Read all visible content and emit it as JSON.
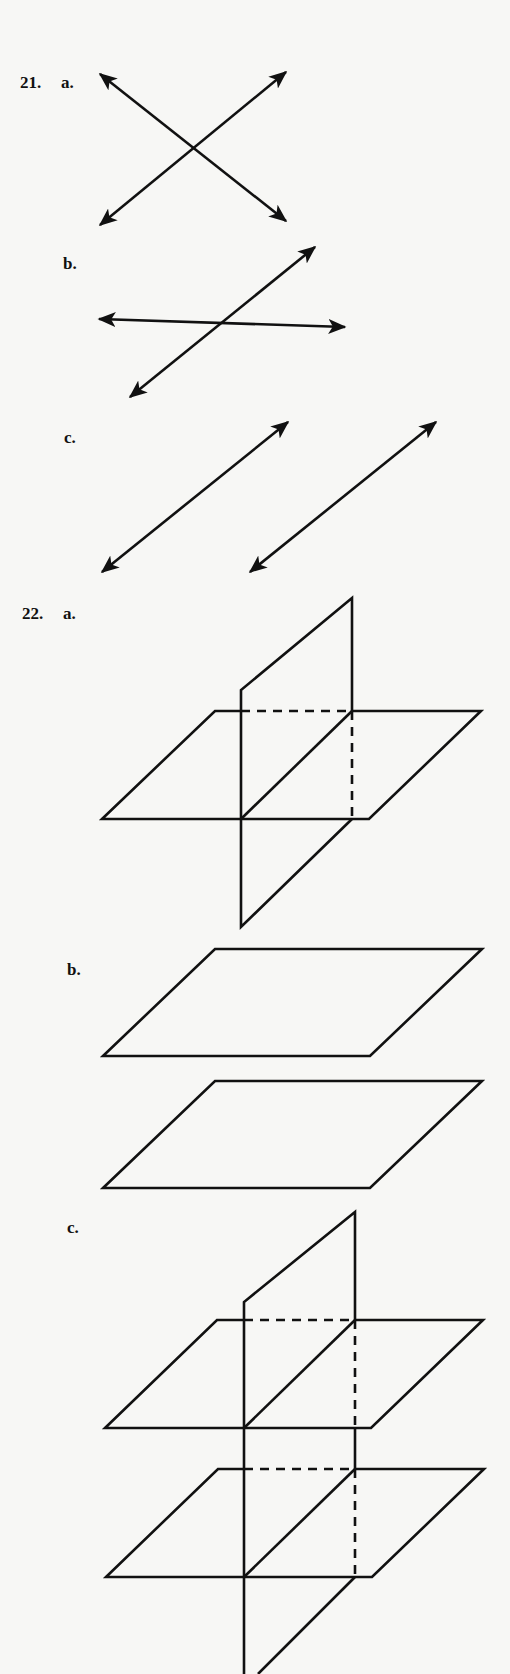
{
  "problems": [
    {
      "number": "21.",
      "parts": [
        {
          "letter": "a.",
          "description": "Two lines intersecting at a point"
        },
        {
          "letter": "b.",
          "description": "Two intersecting lines, one nearly horizontal"
        },
        {
          "letter": "c.",
          "description": "Two parallel lines"
        }
      ]
    },
    {
      "number": "22.",
      "parts": [
        {
          "letter": "a.",
          "description": "Vertical plane intersecting a horizontal plane"
        },
        {
          "letter": "b.",
          "description": "Two parallel horizontal planes"
        },
        {
          "letter": "c.",
          "description": "Vertical plane intersecting two parallel horizontal planes"
        }
      ]
    }
  ],
  "colors": {
    "ink": "#111111",
    "paper": "#f7f7f5"
  }
}
